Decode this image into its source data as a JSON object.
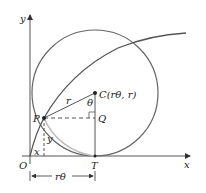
{
  "diagram": {
    "type": "cycloid-construction",
    "axes": {
      "x_label": "x",
      "y_label": "y",
      "origin_label": "O"
    },
    "points": {
      "P": {
        "label": "P"
      },
      "C": {
        "label": "C(rθ, r)"
      },
      "Q": {
        "label": "Q"
      },
      "T": {
        "label": "T"
      }
    },
    "segment_labels": {
      "radius": "r",
      "angle": "θ",
      "x_coord": "x",
      "y_coord": "y",
      "arc_length": "rθ"
    },
    "colors": {
      "stroke": "#555555",
      "arc_light": "#bbbbbb",
      "text": "#222222"
    }
  }
}
